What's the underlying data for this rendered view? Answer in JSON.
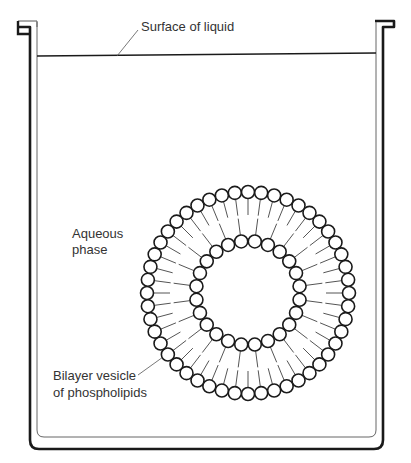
{
  "labels": {
    "surface": "Surface of liquid",
    "aqueous_line1": "Aqueous",
    "aqueous_line2": "phase",
    "vesicle_line1": "Bilayer vesicle",
    "vesicle_line2": "of phospholipids"
  },
  "vesicle": {
    "center_x": 248,
    "center_y": 293,
    "outer_radius": 101,
    "inner_radius": 52,
    "outer_count": 48,
    "inner_count": 24,
    "head_radius": 6.5,
    "outer_tail_length": 30,
    "inner_tail_length": 30
  },
  "colors": {
    "stroke": "#1a1a1a",
    "tail": "#555555",
    "text": "#333333"
  }
}
